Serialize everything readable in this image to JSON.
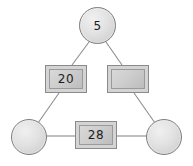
{
  "diagram": {
    "background_color": "#ffffff",
    "edge_color": "#8d8d8d",
    "node_border_color": "#7d7d7d",
    "node_fill_color": "#d4d4d4",
    "label_color": "#1c1c1c",
    "nodes": [
      {
        "id": "top-circle",
        "shape": "circle",
        "label": "5",
        "x": 79,
        "y": 7,
        "width": 37,
        "height": 37
      },
      {
        "id": "left-rect",
        "shape": "rectangle",
        "label": "20",
        "x": 45,
        "y": 65,
        "width": 42,
        "height": 28
      },
      {
        "id": "right-rect",
        "shape": "rectangle",
        "label": "",
        "x": 107,
        "y": 65,
        "width": 42,
        "height": 28
      },
      {
        "id": "bottom-left-circle",
        "shape": "circle",
        "label": "",
        "x": 11,
        "y": 119,
        "width": 36,
        "height": 36
      },
      {
        "id": "bottom-rect",
        "shape": "rectangle",
        "label": "28",
        "x": 75,
        "y": 121,
        "width": 42,
        "height": 28
      },
      {
        "id": "bottom-right-circle",
        "shape": "circle",
        "label": "",
        "x": 146,
        "y": 119,
        "width": 36,
        "height": 36
      }
    ],
    "edges": [
      {
        "id": "edge-top-to-left-rect",
        "from": "top-circle",
        "to": "left-rect",
        "x1": 89,
        "y1": 42,
        "x2": 72,
        "y2": 65
      },
      {
        "id": "edge-top-to-right-rect",
        "from": "top-circle",
        "to": "right-rect",
        "x1": 106,
        "y1": 42,
        "x2": 122,
        "y2": 65
      },
      {
        "id": "edge-left-rect-to-bottom-left-circle",
        "from": "left-rect",
        "to": "bottom-left-circle",
        "x1": 59,
        "y1": 93,
        "x2": 38,
        "y2": 123
      },
      {
        "id": "edge-right-rect-to-bottom-right-circle",
        "from": "right-rect",
        "to": "bottom-right-circle",
        "x1": 134,
        "y1": 93,
        "x2": 155,
        "y2": 123
      },
      {
        "id": "edge-bottom-left-circle-to-bottom-rect",
        "from": "bottom-left-circle",
        "to": "bottom-rect",
        "x1": 46,
        "y1": 136,
        "x2": 75,
        "y2": 136
      },
      {
        "id": "edge-bottom-rect-to-bottom-right-circle",
        "from": "bottom-rect",
        "to": "bottom-right-circle",
        "x1": 117,
        "y1": 136,
        "x2": 147,
        "y2": 136
      }
    ]
  }
}
